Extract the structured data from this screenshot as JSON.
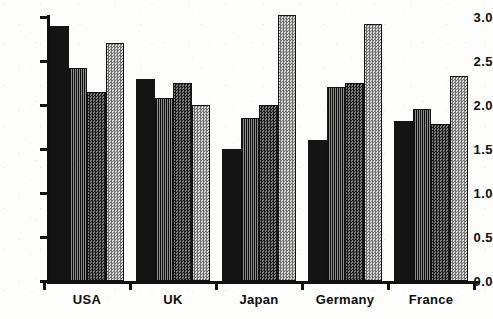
{
  "chart_data": {
    "type": "bar",
    "title": "",
    "subtitle": "",
    "xlabel": "",
    "ylabel": "",
    "categories": [
      "USA",
      "UK",
      "Japan",
      "Germany",
      "France"
    ],
    "ylim": [
      0.0,
      3.0
    ],
    "yticks": [
      "0.0",
      "0.5",
      "1.0",
      "1.5",
      "2.0",
      "2.5",
      "3.0"
    ],
    "ytick_values": [
      0.0,
      0.5,
      1.0,
      1.5,
      2.0,
      2.5,
      3.0
    ],
    "grid": false,
    "legend": "none",
    "series": [
      {
        "name": "Series 1",
        "fill": "solid-black",
        "color": "#141414",
        "values": [
          2.9,
          2.3,
          1.5,
          1.6,
          1.82
        ]
      },
      {
        "name": "Series 2",
        "fill": "vertical-lines",
        "color": "#3a3a3a",
        "values": [
          2.42,
          2.08,
          1.85,
          2.2,
          1.95
        ]
      },
      {
        "name": "Series 3",
        "fill": "dark-checker",
        "color": "#4a4a4a",
        "values": [
          2.15,
          2.25,
          2.0,
          2.25,
          1.78
        ]
      },
      {
        "name": "Series 4",
        "fill": "light-checker",
        "color": "#b4b4b4",
        "values": [
          2.7,
          2.0,
          3.02,
          2.92,
          2.33
        ]
      }
    ]
  },
  "axis": {
    "y_tick_labels": [
      "3.0",
      "2.5",
      "2.0",
      "1.5",
      "1.0",
      "0.5",
      "0.0"
    ],
    "x_group_labels": [
      "USA",
      "UK",
      "Japan",
      "Germany",
      "France"
    ]
  }
}
